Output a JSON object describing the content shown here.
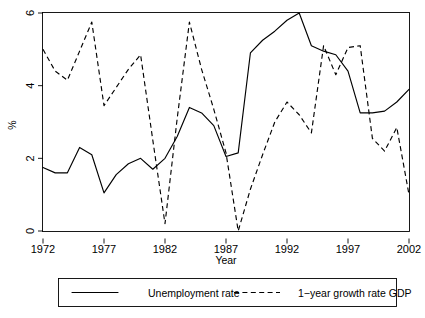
{
  "chart_data": {
    "type": "line",
    "title": "",
    "xlabel": "Year",
    "ylabel": "%",
    "xlim": [
      1972,
      2002
    ],
    "ylim": [
      0,
      6
    ],
    "xticks": [
      1972,
      1977,
      1982,
      1987,
      1992,
      1997,
      2002
    ],
    "yticks": [
      0,
      2,
      4,
      6
    ],
    "grid": false,
    "legend_position": "below-outside",
    "x": [
      1972,
      1973,
      1974,
      1975,
      1976,
      1977,
      1978,
      1979,
      1980,
      1981,
      1982,
      1983,
      1984,
      1985,
      1986,
      1987,
      1988,
      1989,
      1990,
      1991,
      1992,
      1993,
      1994,
      1995,
      1996,
      1997,
      1998,
      1999,
      2000,
      2001,
      2002
    ],
    "series": [
      {
        "name": "Unemployment rate",
        "style": "solid",
        "color": "#000000",
        "values": [
          1.75,
          1.6,
          1.6,
          2.3,
          2.1,
          1.05,
          1.55,
          1.85,
          2.0,
          1.7,
          2.0,
          2.6,
          3.4,
          3.25,
          2.9,
          2.05,
          2.15,
          4.9,
          5.25,
          5.5,
          5.8,
          6.0,
          5.1,
          4.95,
          4.85,
          4.4,
          3.25,
          3.25,
          3.3,
          3.55,
          3.9
        ]
      },
      {
        "name": "1-year growth rate GDP",
        "style": "dashed",
        "color": "#000000",
        "values": [
          5.0,
          4.4,
          4.15,
          4.95,
          5.75,
          3.45,
          3.95,
          4.45,
          4.85,
          2.5,
          0.2,
          3.1,
          5.75,
          4.45,
          3.35,
          2.15,
          0.0,
          1.15,
          2.1,
          3.0,
          3.55,
          3.2,
          2.7,
          5.1,
          4.3,
          5.05,
          5.1,
          2.55,
          2.2,
          2.85,
          1.0
        ]
      }
    ],
    "legend": [
      {
        "label": "Unemployment rate",
        "style": "solid"
      },
      {
        "label": "1−year growth rate GDP",
        "style": "dashed"
      }
    ]
  }
}
